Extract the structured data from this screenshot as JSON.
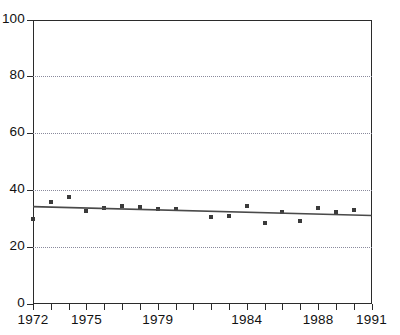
{
  "chart_data": {
    "type": "scatter",
    "title": "",
    "subtitle": "",
    "xlabel": "",
    "ylabel": "",
    "xlim": [
      1972,
      1991
    ],
    "ylim": [
      0,
      100
    ],
    "grid": true,
    "grid_axis": "y",
    "legend": "none",
    "yticks": [
      0,
      20,
      40,
      60,
      80,
      100
    ],
    "ytick_labels": [
      "0",
      "20",
      "40",
      "60",
      "80",
      "100"
    ],
    "xticks": [
      1972,
      1973,
      1974,
      1975,
      1976,
      1977,
      1978,
      1979,
      1980,
      1981,
      1982,
      1983,
      1984,
      1985,
      1986,
      1987,
      1988,
      1989,
      1990,
      1991
    ],
    "xtick_labels_shown": [
      "1972",
      "1975",
      "1979",
      "1984",
      "1988",
      "1991"
    ],
    "xtick_label_years": [
      1972,
      1975,
      1979,
      1984,
      1988,
      1991
    ],
    "series": [
      {
        "name": "observations",
        "type": "scatter",
        "marker": "square",
        "color": "#3a3a3a",
        "x": [
          1972,
          1973,
          1974,
          1975,
          1976,
          1977,
          1978,
          1979,
          1980,
          1982,
          1983,
          1984,
          1985,
          1986,
          1987,
          1988,
          1989,
          1990
        ],
        "values": [
          30.0,
          35.8,
          37.7,
          32.7,
          33.8,
          34.6,
          34.0,
          33.5,
          33.5,
          30.6,
          30.9,
          34.5,
          28.5,
          32.3,
          29.0,
          33.8,
          32.5,
          33.1
        ]
      },
      {
        "name": "trend-line",
        "type": "line",
        "color": "#4a4a4a",
        "x": [
          1972,
          1991
        ],
        "values": [
          34.2,
          31.1
        ]
      }
    ]
  },
  "axes": {
    "y_axis_name": "y-axis",
    "x_axis_name": "x-axis"
  }
}
